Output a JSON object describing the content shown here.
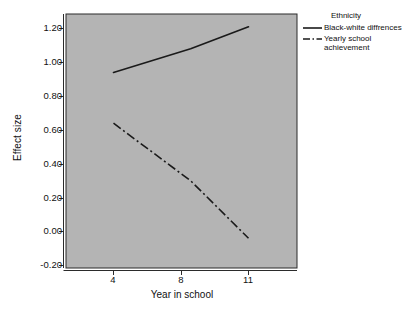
{
  "chart_data": {
    "type": "line",
    "title": "",
    "xlabel": "Year in school",
    "ylabel": "Effect size",
    "x": [
      4,
      8,
      11
    ],
    "xticks": [
      "4",
      "8",
      "11"
    ],
    "yticks": [
      "1.20",
      "1.00",
      "0.80",
      "0.60",
      "0.40",
      "0.20",
      "0.00",
      "-0.20"
    ],
    "ytick_values": [
      1.2,
      1.0,
      0.8,
      0.6,
      0.4,
      0.2,
      0.0,
      -0.2
    ],
    "xlim": [
      2.5,
      12.5
    ],
    "ylim": [
      -0.3,
      1.3
    ],
    "grid": false,
    "legend_position": "right",
    "legend_title": "Ethnicity",
    "plot_background": "#b4b4b4",
    "line_color": "#1a1a1a",
    "series": [
      {
        "name": "Black-white diffrences",
        "style": "solid",
        "values": [
          0.94,
          1.08,
          1.21
        ]
      },
      {
        "name": "Yearly school achievement",
        "style": "dash-dot",
        "values": [
          0.64,
          0.3,
          -0.04
        ]
      }
    ]
  },
  "axes": {
    "y_title": "Effect size",
    "x_title": "Year in school"
  },
  "legend": {
    "title": "Ethnicity",
    "entries": [
      {
        "label_line1": "Black-white diffrences",
        "label_line2": ""
      },
      {
        "label_line1": "Yearly school",
        "label_line2": "achievement"
      }
    ]
  }
}
